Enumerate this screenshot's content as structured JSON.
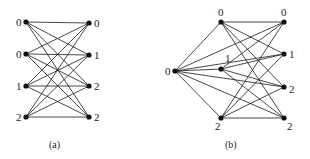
{
  "figure_a": {
    "caption": "(a)",
    "left_nodes": [
      {
        "label": "0",
        "x": 26,
        "y": 22
      },
      {
        "label": "0",
        "x": 26,
        "y": 54
      },
      {
        "label": "1",
        "x": 26,
        "y": 86
      },
      {
        "label": "2",
        "x": 26,
        "y": 117
      }
    ],
    "right_nodes": [
      {
        "label": "0",
        "x": 89,
        "y": 23
      },
      {
        "label": "1",
        "x": 89,
        "y": 55
      },
      {
        "label": "2",
        "x": 89,
        "y": 86
      },
      {
        "label": "2",
        "x": 89,
        "y": 117
      }
    ],
    "edges": "complete bipartite: every left node to every right node"
  },
  "figure_b": {
    "caption": "(b)",
    "source_node": {
      "label": "0",
      "x": 175,
      "y": 71
    },
    "middle_nodes": [
      {
        "label": "0",
        "x": 221,
        "y": 22
      },
      {
        "label": "1",
        "x": 221,
        "y": 69
      },
      {
        "label": "2",
        "x": 221,
        "y": 118
      }
    ],
    "right_nodes": [
      {
        "label": "0",
        "x": 284,
        "y": 22
      },
      {
        "label": "1",
        "x": 284,
        "y": 54
      },
      {
        "label": "2",
        "x": 284,
        "y": 87
      },
      {
        "label": "2",
        "x": 284,
        "y": 118
      }
    ],
    "edges": "source to all middle and right nodes; every middle node to every right node"
  }
}
